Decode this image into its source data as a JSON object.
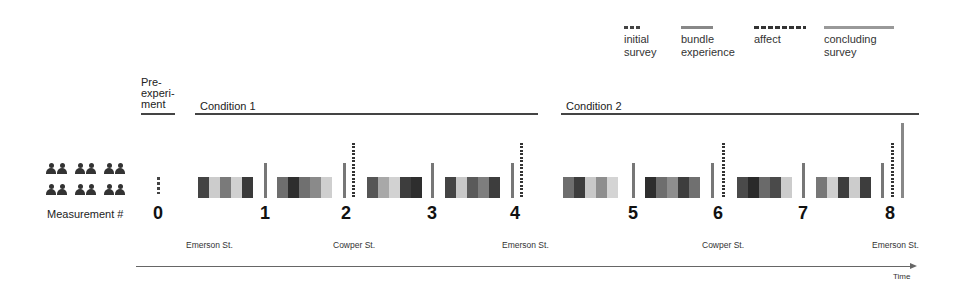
{
  "legend": [
    {
      "id": "initial",
      "label": "initial\nsurvey",
      "line1": "initial",
      "line2": "survey",
      "style": "dashed"
    },
    {
      "id": "bundle",
      "label": "bundle experience",
      "line1": "bundle",
      "line2": "experience",
      "style": "solid"
    },
    {
      "id": "affect",
      "label": "affect",
      "line1": "affect",
      "line2": "",
      "style": "dotted"
    },
    {
      "id": "concluding",
      "label": "concluding survey",
      "line1": "concluding",
      "line2": "survey",
      "style": "solid"
    }
  ],
  "phases": {
    "pre": {
      "line1": "Pre-",
      "line2": "experi-",
      "line3": "ment"
    },
    "condition1": "Condition 1",
    "condition2": "Condition 2"
  },
  "participants": {
    "count": 12,
    "icon": "person-icon"
  },
  "measurement_label": "Measurement #",
  "measurements": [
    "0",
    "1",
    "2",
    "3",
    "4",
    "5",
    "6",
    "7",
    "8"
  ],
  "streets": [
    {
      "label": "Emerson St."
    },
    {
      "label": "Cowper St."
    },
    {
      "label": "Emerson St."
    },
    {
      "label": "Cowper St."
    },
    {
      "label": "Emerson St."
    }
  ],
  "time_label": "Time",
  "colors": {
    "dark": "#3d3d3d",
    "darker": "#2a2a2a",
    "mid": "#6e6e6e",
    "midlight": "#8a8a8a",
    "light": "#c4c4c4",
    "pale": "#d6d6d6"
  },
  "block_groups": [
    [
      "#444444",
      "#cccccc",
      "#7a7a7a",
      "#d0d0d0",
      "#3a3a3a"
    ],
    [
      "#6e6e6e",
      "#2e2e2e",
      "#707070",
      "#8a8a8a",
      "#cfcfcf"
    ],
    [
      "#555555",
      "#a8a8a8",
      "#d2d2d2",
      "#3d3d3d",
      "#2e2e2e"
    ],
    [
      "#444444",
      "#c8c8c8",
      "#5a5a5a",
      "#7e7e7e",
      "#3d3d3d"
    ],
    [
      "#6e6e6e",
      "#3d3d3d",
      "#c8c8c8",
      "#8e8e8e",
      "#d4d4d4"
    ],
    [
      "#2e2e2e",
      "#6e6e6e",
      "#8e8e8e",
      "#3d3d3d",
      "#707070"
    ],
    [
      "#4a4a4a",
      "#2a2a2a",
      "#6a6a6a",
      "#4a4a4a",
      "#cccccc"
    ],
    [
      "#777777",
      "#cfcfcf",
      "#3d3d3d",
      "#cccccc",
      "#3d3d3d"
    ]
  ]
}
